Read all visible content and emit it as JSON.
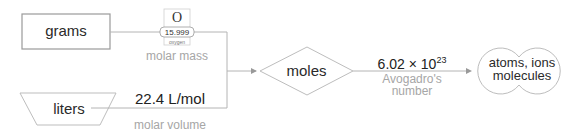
{
  "diagram": {
    "nodes": {
      "grams": {
        "label": "grams",
        "shape": "rectangle"
      },
      "liters": {
        "label": "liters",
        "shape": "trapezoid"
      },
      "moles": {
        "label": "moles",
        "shape": "diamond"
      },
      "particles": {
        "label_line1": "atoms, ions",
        "label_line2": "molecules",
        "shape": "double-circle"
      }
    },
    "conversions": {
      "molar_mass": {
        "caption": "molar mass",
        "element_tile": {
          "symbol": "O",
          "mass": "15.999",
          "name": "oxygen"
        }
      },
      "molar_volume": {
        "value": "22.4 L/mol",
        "caption": "molar volume"
      },
      "avogadro": {
        "value_base": "6.02 × 10",
        "value_exp": "23",
        "caption_line1": "Avogadro's",
        "caption_line2": "number"
      }
    },
    "colors": {
      "stroke": "#b4b4b4",
      "text": "#2a2a2a",
      "caption": "#a6a6a6"
    }
  }
}
